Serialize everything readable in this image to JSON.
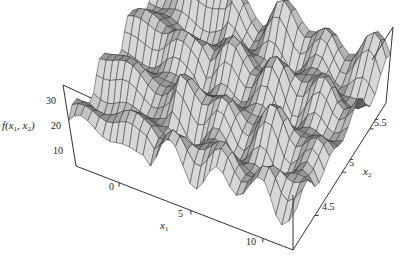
{
  "chart_data": {
    "type": "surface3d",
    "title": "",
    "zlabel": "f(x1, x2)",
    "xlabel": "x1",
    "ylabel": "x2",
    "x_ticks": [
      "0",
      "5",
      "10"
    ],
    "y_ticks": [
      "4.5",
      "5",
      "5.5"
    ],
    "z_ticks": [
      "10",
      "20",
      "30"
    ],
    "xlim": [
      -3,
      12.1
    ],
    "ylim": [
      4.1,
      5.8
    ],
    "zlim": [
      5,
      35
    ],
    "function_hint": "sum of oscillating terms in x1 and x2 (wavy ridges along x1, periodic in x2)",
    "grid": false,
    "box": true,
    "colors": {
      "face_light": "#c8c8c8",
      "face_mid": "#a0a0a0",
      "face_dark": "#6e6e6e",
      "mesh": "#333333",
      "axis": "#333333"
    }
  },
  "labels": {
    "z_axis": "f(x",
    "z_axis_sub1": "1",
    "z_axis_mid": ", x",
    "z_axis_sub2": "2",
    "z_axis_end": ")",
    "x_axis": "x",
    "x_axis_sub": "1",
    "y_axis": "x",
    "y_axis_sub": "2",
    "z_ticks": [
      "30",
      "20",
      "10"
    ],
    "x_ticks": [
      "0",
      "5",
      "10"
    ],
    "y_ticks": [
      "4.5",
      "5",
      "5.5"
    ]
  }
}
